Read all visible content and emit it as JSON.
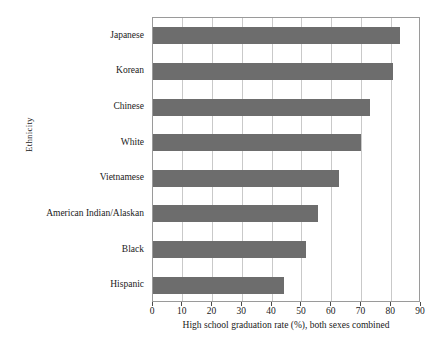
{
  "chart_data": {
    "type": "bar",
    "orientation": "horizontal",
    "title": "",
    "xlabel": "High school graduation rate (%), both sexes combined",
    "ylabel": "Ethnicity",
    "categories": [
      "Japanese",
      "Korean",
      "Chinese",
      "White",
      "Vietnamese",
      "American Indian/Alaskan",
      "Black",
      "Hispanic"
    ],
    "values": [
      83,
      80.5,
      73,
      70,
      62.5,
      55.5,
      51.5,
      44
    ],
    "xlim": [
      0,
      90
    ],
    "xticks": [
      0,
      10,
      20,
      30,
      40,
      50,
      60,
      70,
      80,
      90
    ],
    "xtick_labels": [
      "0",
      "10",
      "20",
      "30",
      "40",
      "50",
      "60",
      "70",
      "80",
      "90"
    ],
    "grid": "vertical",
    "legend": "none",
    "bar_color": "#6d6d6d",
    "grid_color": "#c9c9c9",
    "axis_color": "#9a9a9a",
    "background_color": "#ffffff"
  }
}
